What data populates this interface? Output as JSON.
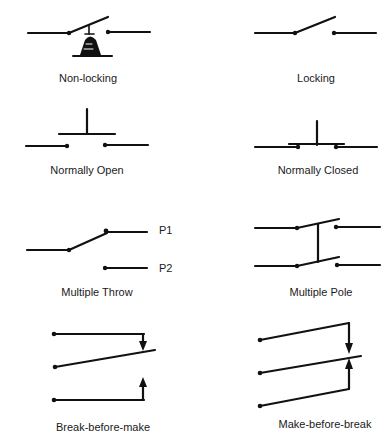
{
  "colors": {
    "stroke": "#111111",
    "background": "#ffffff"
  },
  "symbols": [
    {
      "id": "non-locking",
      "label": "Non-locking"
    },
    {
      "id": "locking",
      "label": "Locking"
    },
    {
      "id": "normally-open",
      "label": "Normally Open"
    },
    {
      "id": "normally-closed",
      "label": "Normally Closed"
    },
    {
      "id": "multiple-throw",
      "label": "Multiple Throw",
      "terminals": [
        "P1",
        "P2"
      ]
    },
    {
      "id": "multiple-pole",
      "label": "Multiple Pole"
    },
    {
      "id": "break-before-make",
      "label": "Break-before-make"
    },
    {
      "id": "make-before-break",
      "label": "Make-before-break"
    }
  ]
}
